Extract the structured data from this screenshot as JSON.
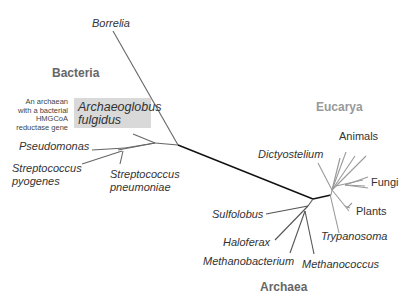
{
  "diagram": {
    "type": "unrooted phylogenetic tree",
    "domains": {
      "bacteria": "Bacteria",
      "eucarya": "Eucarya",
      "archaea": "Archaea"
    },
    "bacteria_taxa": {
      "borrelia": "Borrelia",
      "pseudomonas": "Pseudomonas",
      "strep_pyogenes_1": "Streptococcus",
      "strep_pyogenes_2": "pyogenes",
      "strep_pneumoniae_1": "Streptococcus",
      "strep_pneumoniae_2": "pneumoniae"
    },
    "highlight": {
      "line1": "Archaeoglobus",
      "line2": "fulgidus",
      "note_lines": [
        "An archaean",
        "with a bacterial",
        "HMGCoA",
        "reductase gene"
      ]
    },
    "eucarya_taxa": {
      "dictyostelium": "Dictyostelium",
      "animals": "Animals",
      "fungi": "Fungi",
      "plants": "Plants",
      "trypanosoma": "Trypanosoma"
    },
    "archaea_taxa": {
      "sulfolobus": "Sulfolobus",
      "haloferax": "Haloferax",
      "methanobacterium": "Methanobacterium",
      "methanococcus": "Methanococcus"
    },
    "colors": {
      "bacteria_branch": "#666666",
      "eucarya_branch": "#9a9a9a",
      "archaea_branch": "#555555",
      "root_branch": "#111111",
      "highlight_bg": "#d9d9d9",
      "domain_label": "#666666",
      "eucarya_label": "#999999"
    }
  }
}
